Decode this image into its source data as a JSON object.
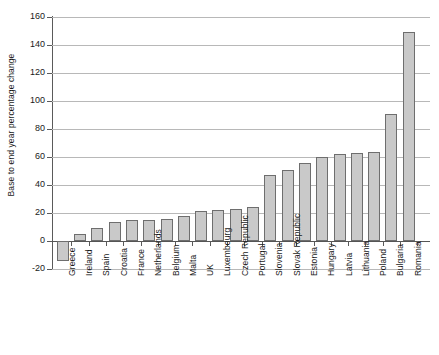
{
  "chart_data": {
    "type": "bar",
    "title": "",
    "xlabel": "",
    "ylabel": "Base to end year percentage change",
    "ylim": [
      -20,
      160
    ],
    "yticks": [
      -20,
      0,
      20,
      40,
      60,
      80,
      100,
      120,
      140,
      160
    ],
    "ytick_labels": [
      "-20",
      "0",
      "20",
      "40",
      "60",
      "80",
      "100",
      "120",
      "140",
      "160"
    ],
    "grid": true,
    "legend": false,
    "bar_color": "#c9c9c9",
    "bar_border_color": "#6e6e6e",
    "categories": [
      "Greece",
      "Ireland",
      "Spain",
      "Croatia",
      "France",
      "Netherlands",
      "Belgium",
      "Malta",
      "UK",
      "Luxembourg",
      "Czech Republic",
      "Portugal",
      "Slovenia",
      "Slovak Republic",
      "Estonia",
      "Hungary",
      "Latvia",
      "Lithuania",
      "Poland",
      "Bulgaria",
      "Romania"
    ],
    "values": [
      -14,
      5,
      9,
      13.5,
      15,
      15,
      16,
      18,
      21.5,
      22,
      23,
      24,
      47,
      51,
      56,
      60,
      62.5,
      63,
      63.5,
      91,
      149
    ]
  }
}
